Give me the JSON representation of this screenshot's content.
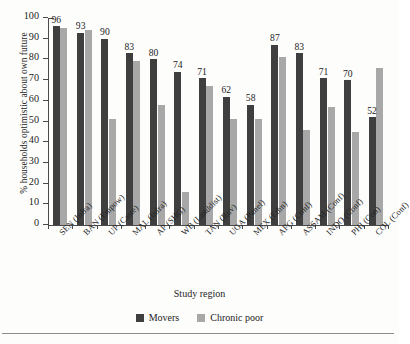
{
  "chart_data": {
    "type": "bar",
    "title": "",
    "xlabel": "Study region",
    "ylabel": "% households optimistic about own future",
    "ylim": [
      0,
      100
    ],
    "yticks": [
      0,
      10,
      20,
      30,
      40,
      50,
      60,
      70,
      80,
      90,
      100
    ],
    "grid": false,
    "legend_position": "bottom-center",
    "categories": [
      "SEN (Infra)",
      "BAN (Empow)",
      "UP (Caste)",
      "MAL (Infra)",
      "AP (SHG)",
      "WB (Landdist)",
      "TAN (Ruv)",
      "UGA (Panel)",
      "MEX (Ethn)",
      "AFG (Conf)",
      "ASSAM (Conf)",
      "INDO (Conf)",
      "PHI (Con)",
      "COL (Conf)"
    ],
    "series": [
      {
        "name": "Movers",
        "color": "#3f3f3f",
        "values": [
          96,
          93,
          90,
          83,
          80,
          74,
          71,
          62,
          58,
          87,
          83,
          71,
          70,
          52
        ],
        "labels": [
          "96",
          "93",
          "90",
          "83",
          "80",
          "74",
          "71",
          "62",
          "58",
          "87",
          "83",
          "71",
          "70",
          "52"
        ]
      },
      {
        "name": "Chronic poor",
        "color": "#a8a8a8",
        "values": [
          95,
          94,
          51,
          79,
          58,
          16,
          67,
          51,
          51,
          81,
          46,
          57,
          45,
          76
        ],
        "labels": []
      }
    ]
  },
  "axis": {
    "ylabel": "% households optimistic about own future",
    "xlabel": "Study region",
    "ytick_labels": [
      "100",
      "90",
      "80",
      "70",
      "60",
      "50",
      "40",
      "30",
      "20",
      "10",
      "0"
    ]
  },
  "legend": {
    "items": [
      {
        "label": "Movers",
        "color": "#3f3f3f"
      },
      {
        "label": "Chronic poor",
        "color": "#a8a8a8"
      }
    ]
  }
}
